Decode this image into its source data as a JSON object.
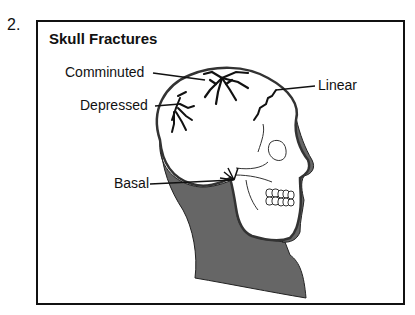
{
  "figure": {
    "number": "2.",
    "title": "Skull Fractures",
    "labels": {
      "comminuted": "Comminuted",
      "depressed": "Depressed",
      "linear": "Linear",
      "basal": "Basal"
    }
  },
  "colors": {
    "ink": "#111111",
    "shade": "#666666",
    "background": "#ffffff"
  }
}
